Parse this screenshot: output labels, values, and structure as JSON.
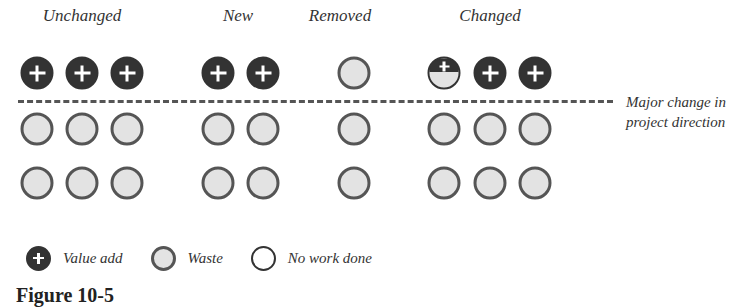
{
  "columns": [
    {
      "key": "unchanged",
      "label": "Unchanged",
      "x": 82
    },
    {
      "key": "new",
      "label": "New",
      "x": 238
    },
    {
      "key": "removed",
      "label": "Removed",
      "x": 340
    },
    {
      "key": "changed",
      "label": "Changed",
      "x": 490
    }
  ],
  "rows": {
    "before_change": {
      "unchanged": [
        "value",
        "value",
        "value"
      ],
      "new": [
        "value",
        "value"
      ],
      "removed": [
        "waste"
      ],
      "changed": [
        "partial",
        "value",
        "value"
      ]
    },
    "after_change_1": {
      "unchanged": [
        "waste",
        "waste",
        "waste"
      ],
      "new": [
        "waste",
        "waste"
      ],
      "removed": [
        "waste"
      ],
      "changed": [
        "waste",
        "waste",
        "waste"
      ]
    },
    "after_change_2": {
      "unchanged": [
        "waste",
        "waste",
        "waste"
      ],
      "new": [
        "waste",
        "waste"
      ],
      "removed": [
        "waste"
      ],
      "changed": [
        "waste",
        "waste",
        "waste"
      ]
    }
  },
  "divider": {
    "annotation_line1": "Major change in",
    "annotation_line2": "project direction"
  },
  "legend": {
    "value_add": "Value add",
    "waste": "Waste",
    "no_work": "No work done"
  },
  "caption": "Figure 10-5",
  "colors": {
    "value_add": "#333333",
    "waste_fill": "#e3e3e3",
    "waste_border": "#555555",
    "no_work_fill": "#ffffff"
  }
}
